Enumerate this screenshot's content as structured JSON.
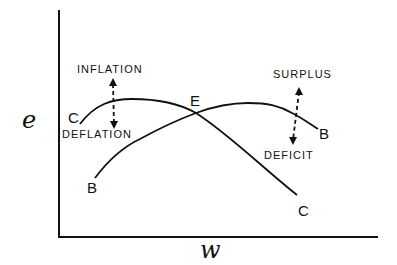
{
  "diagram": {
    "axes": {
      "y_label": "e",
      "x_label": "w"
    },
    "curves": [
      {
        "name": "C",
        "start_label": "C",
        "end_label": "C",
        "shape": "inverted-U, declining steeply to the right"
      },
      {
        "name": "B",
        "start_label": "B",
        "end_label": "B",
        "shape": "rising from lower left, peaking right of E, declining slightly"
      }
    ],
    "intersection": {
      "label": "E"
    },
    "annotations": {
      "inflation": "INFLATION",
      "deflation": "DEFLATION",
      "surplus": "SURPLUS",
      "deficit": "DEFICIT"
    },
    "colors": {
      "ink": "#111111",
      "background": "#ffffff"
    }
  }
}
